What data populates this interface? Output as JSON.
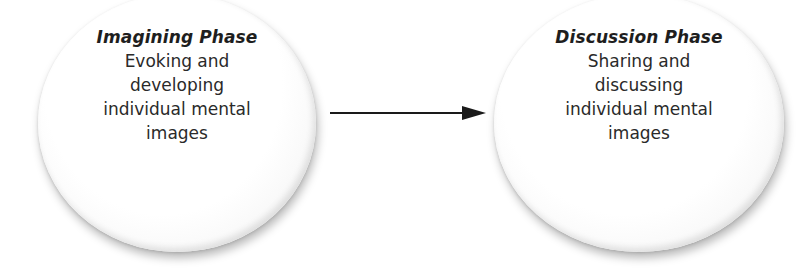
{
  "diagram": {
    "type": "process-flow",
    "phases": [
      {
        "title": "Imagining Phase",
        "description_lines": [
          "Evoking and",
          "developing",
          "individual mental",
          "images"
        ]
      },
      {
        "title": "Discussion Phase",
        "description_lines": [
          "Sharing and",
          "discussing",
          "individual mental",
          "images"
        ]
      }
    ],
    "connector": {
      "from": "Imagining Phase",
      "to": "Discussion Phase",
      "style": "solid-arrow",
      "color": "#1a1a1a"
    },
    "colors": {
      "circle_fill": "#ffffff",
      "text": "#222222",
      "background": "#ffffff"
    }
  }
}
